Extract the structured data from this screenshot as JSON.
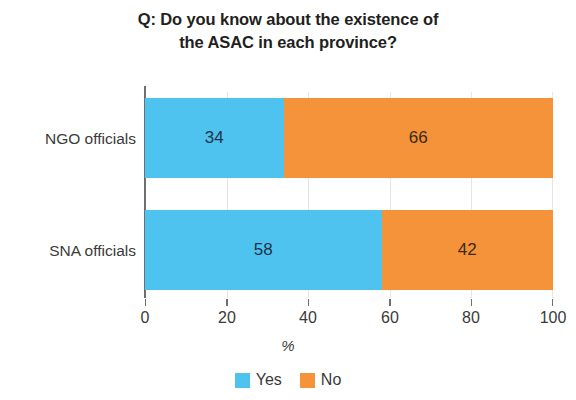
{
  "chart_data": {
    "type": "bar",
    "orientation": "horizontal",
    "stacked": true,
    "stack_total": 100,
    "title": "Q: Do you know about the existence of the ASAC in each province?",
    "title_lines": [
      "Q: Do you know about the existence of",
      "the ASAC in each province?"
    ],
    "categories": [
      "NGO officials",
      "SNA officials"
    ],
    "series": [
      {
        "name": "Yes",
        "values": [
          34,
          58
        ],
        "color": "#4ec3f0"
      },
      {
        "name": "No",
        "values": [
          66,
          42
        ],
        "color": "#f5933b"
      }
    ],
    "xlabel": "%",
    "ylabel": "",
    "xlim": [
      0,
      100
    ],
    "xticks": [
      0,
      20,
      40,
      60,
      80,
      100
    ],
    "xtick_labels": [
      "0",
      "20",
      "40",
      "60",
      "80",
      "100"
    ],
    "grid": true,
    "grid_axis": "x",
    "legend_position": "bottom",
    "data_labels": {
      "ngo_yes": "34",
      "ngo_no": "66",
      "sna_yes": "58",
      "sna_no": "42"
    }
  },
  "rows": [
    {
      "category": "NGO officials",
      "yes_value": "34",
      "no_value": "66",
      "yes_pct": 34,
      "no_pct": 66
    },
    {
      "category": "SNA officials",
      "yes_value": "58",
      "no_value": "42",
      "yes_pct": 58,
      "no_pct": 42
    }
  ],
  "legend": {
    "items": [
      {
        "label": "Yes",
        "color": "#4ec3f0"
      },
      {
        "label": "No",
        "color": "#f5933b"
      }
    ]
  },
  "axis": {
    "x_title": "%",
    "ticks": [
      "0",
      "20",
      "40",
      "60",
      "80",
      "100"
    ]
  },
  "colors": {
    "yes": "#4ec3f0",
    "no": "#f5933b",
    "axis": "#6f6f6f",
    "grid": "#e9e4dd",
    "title_text": "#231f20",
    "tick_text": "#3a3a3a",
    "label_on_blue": "#1f3347",
    "label_on_orange": "#3b2a16",
    "background": "#ffffff"
  }
}
